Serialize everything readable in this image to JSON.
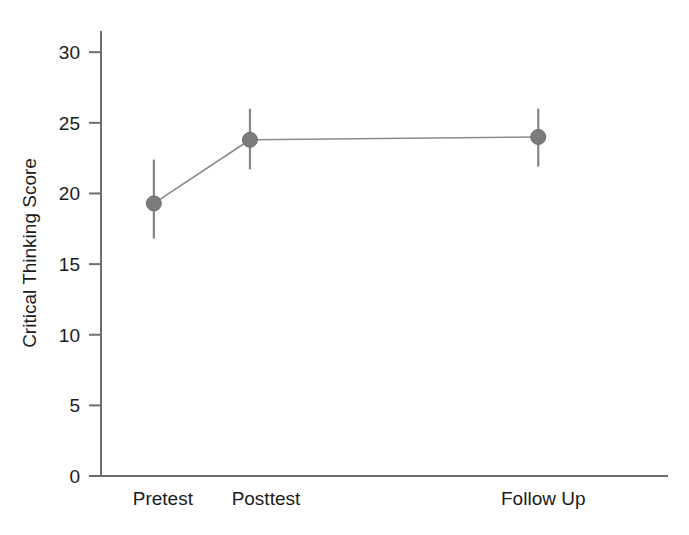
{
  "chart_data": {
    "type": "line",
    "title": "",
    "subtitle": "",
    "xlabel": "",
    "ylabel": "Critical Thinking Score",
    "categories": [
      "Pretest",
      "Posttest",
      "Follow Up"
    ],
    "x": [
      1,
      2,
      5
    ],
    "xlim": [
      0.45,
      6.35
    ],
    "ylim": [
      0,
      31.5
    ],
    "yticks": [
      0,
      5,
      10,
      15,
      20,
      25,
      30
    ],
    "ytick_labels": [
      "0",
      "5",
      "10",
      "15",
      "20",
      "25",
      "30"
    ],
    "grid": false,
    "legend": null,
    "legend_position": "none",
    "marker": "filled-circle",
    "marker_color": "#7c7c7c",
    "line_color": "#8a8a8a",
    "axis_color": "#6e6e6e",
    "text_color": "#1b1b1b",
    "error_bars": true,
    "series": [
      {
        "name": "Critical Thinking Score",
        "values": [
          19.3,
          23.8,
          24.0
        ],
        "err_low": [
          16.8,
          21.7,
          21.9
        ],
        "err_high": [
          22.4,
          26.0,
          26.0
        ]
      }
    ],
    "points": [
      {
        "category": "Pretest",
        "value": 19.3,
        "ci_low": 16.8,
        "ci_high": 22.4
      },
      {
        "category": "Posttest",
        "value": 23.8,
        "ci_low": 21.7,
        "ci_high": 26.0
      },
      {
        "category": "Follow Up",
        "value": 24.0,
        "ci_low": 21.9,
        "ci_high": 26.0
      }
    ],
    "annotations": []
  }
}
